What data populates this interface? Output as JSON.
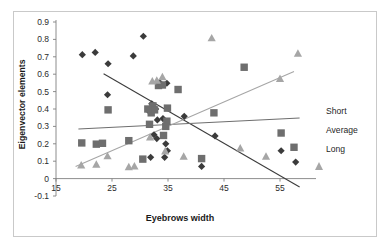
{
  "chart_data": {
    "type": "scatter",
    "title": "",
    "xlabel": "Eyebrows width",
    "ylabel": "Eigenvector elements",
    "xlim": [
      15,
      60
    ],
    "ylim": [
      -0.1,
      0.9
    ],
    "xticks": [
      15,
      25,
      35,
      45,
      55
    ],
    "yticks": [
      -0.1,
      0,
      0.1,
      0.2,
      0.3,
      0.4,
      0.5,
      0.6,
      0.7,
      0.8,
      0.9
    ],
    "grid": false,
    "legend_position": "right",
    "colors": {
      "short": "#3b3b3b",
      "average": "#6e6e6e",
      "long": "#a6a6a6",
      "frame": "#c9c9c9",
      "axis": "#808080"
    },
    "series": [
      {
        "name": "Short",
        "marker": "diamond",
        "color": "#3b3b3b",
        "points": [
          [
            19.7,
            0.712
          ],
          [
            22.0,
            0.725
          ],
          [
            24.3,
            0.66
          ],
          [
            28.8,
            0.705
          ],
          [
            30.6,
            0.818
          ],
          [
            24.2,
            0.482
          ],
          [
            33.5,
            0.553
          ],
          [
            34.8,
            0.548
          ],
          [
            32.8,
            0.4
          ],
          [
            33.1,
            0.337
          ],
          [
            31.5,
            0.39
          ],
          [
            32.5,
            0.252
          ],
          [
            33.0,
            0.23
          ],
          [
            34.6,
            0.2
          ],
          [
            34.9,
            0.16
          ],
          [
            31.9,
            0.122
          ],
          [
            34.4,
            0.122
          ],
          [
            37.9,
            0.358
          ],
          [
            41.0,
            0.07
          ],
          [
            43.4,
            0.245
          ],
          [
            55.2,
            0.16
          ],
          [
            57.8,
            0.095
          ],
          [
            34.1,
            0.345
          ],
          [
            32.1,
            0.43
          ]
        ],
        "trendline": {
          "slope": -0.0186,
          "intercept": 1.04,
          "x_start": 23.5,
          "x_end": 58.5
        }
      },
      {
        "name": "Average",
        "marker": "square",
        "color": "#6e6e6e",
        "points": [
          [
            19.6,
            0.205
          ],
          [
            22.2,
            0.198
          ],
          [
            23.3,
            0.203
          ],
          [
            24.3,
            0.395
          ],
          [
            28.0,
            0.218
          ],
          [
            30.5,
            0.112
          ],
          [
            31.7,
            0.312
          ],
          [
            32.0,
            0.378
          ],
          [
            32.3,
            0.418
          ],
          [
            33.3,
            0.535
          ],
          [
            34.0,
            0.538
          ],
          [
            34.9,
            0.405
          ],
          [
            34.6,
            0.3
          ],
          [
            34.2,
            0.248
          ],
          [
            36.8,
            0.512
          ],
          [
            41.0,
            0.115
          ],
          [
            43.2,
            0.378
          ],
          [
            48.6,
            0.64
          ],
          [
            55.2,
            0.262
          ],
          [
            57.5,
            0.18
          ],
          [
            32.6,
            0.395
          ],
          [
            31.4,
            0.4
          ],
          [
            34.8,
            0.33
          ]
        ],
        "trendline": {
          "slope": 0.0016,
          "intercept": 0.255,
          "x_start": 19.0,
          "x_end": 58.5
        }
      },
      {
        "name": "Long",
        "marker": "triangle",
        "color": "#a6a6a6",
        "points": [
          [
            19.5,
            0.078
          ],
          [
            22.2,
            0.082
          ],
          [
            24.2,
            0.13
          ],
          [
            28.0,
            0.068
          ],
          [
            29.0,
            0.072
          ],
          [
            31.8,
            0.238
          ],
          [
            33.0,
            0.565
          ],
          [
            34.0,
            0.585
          ],
          [
            34.5,
            0.158
          ],
          [
            37.8,
            0.128
          ],
          [
            42.8,
            0.808
          ],
          [
            47.9,
            0.175
          ],
          [
            52.5,
            0.128
          ],
          [
            55.0,
            0.575
          ],
          [
            58.2,
            0.72
          ],
          [
            32.2,
            0.56
          ]
        ],
        "trendline": {
          "slope": 0.014,
          "intercept": -0.19,
          "x_start": 18.5,
          "x_end": 57.5
        }
      }
    ]
  },
  "legend": {
    "items": [
      {
        "label": "Short",
        "marker": "diamond"
      },
      {
        "label": "Average",
        "marker": "square"
      },
      {
        "label": "Long",
        "marker": "triangle"
      }
    ]
  },
  "axes": {
    "y_title": "Eigenvector elements",
    "x_title": "Eyebrows width",
    "y_tick_labels": [
      "0.9",
      "0.8",
      "0.7",
      "0.6",
      "0.5",
      "0.4",
      "0.3",
      "0.2",
      "0.1",
      "0",
      "-0.1"
    ],
    "x_tick_labels": [
      "15",
      "25",
      "35",
      "45",
      "55"
    ]
  }
}
